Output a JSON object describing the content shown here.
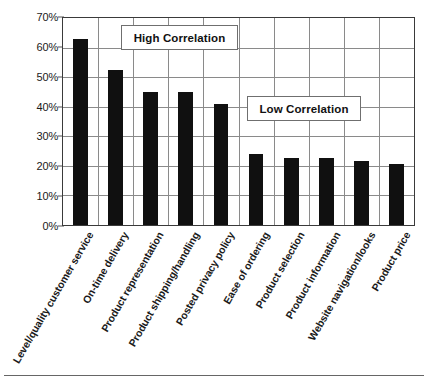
{
  "chart_data": {
    "type": "bar",
    "title": "",
    "xlabel": "",
    "ylabel": "",
    "ylim": [
      0,
      70
    ],
    "ytick_labels": [
      "70%",
      "60%",
      "50%",
      "40%",
      "30%",
      "20%",
      "10%",
      "0%"
    ],
    "ytick_values": [
      70,
      60,
      50,
      40,
      30,
      20,
      10,
      0
    ],
    "grid": true,
    "legend_position": "none",
    "bar_color": "#101010",
    "grid_color": "#8a8a8a",
    "axis_color": "#3a3a3a",
    "categories": [
      "Level/quality customer service",
      "On-time delivery",
      "Product representation",
      "Product shipping/handling",
      "Posted privacy policy",
      "Ease of ordering",
      "Product selection",
      "Product information",
      "Website navigation/looks",
      "Product price"
    ],
    "values": [
      63,
      52.5,
      45,
      45,
      41,
      24,
      22.5,
      22.5,
      21.5,
      20.5
    ],
    "annotations": [
      {
        "text": "High Correlation",
        "covers": "bars 1-5"
      },
      {
        "text": "Low Correlation",
        "covers": "bars 6-10"
      }
    ]
  }
}
